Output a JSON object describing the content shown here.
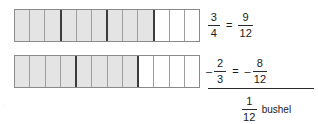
{
  "bar_models": [
    {
      "name": "three-fourths-bar",
      "total_segments": 12,
      "shaded_segments": 9,
      "major_divider_after": [
        3,
        6,
        9
      ],
      "represents": "3/4",
      "equivalent": "9/12"
    },
    {
      "name": "two-thirds-bar",
      "total_segments": 12,
      "shaded_segments": 8,
      "major_divider_after": [
        4,
        8
      ],
      "represents": "2/3",
      "equivalent": "8/12"
    }
  ],
  "equations": {
    "row1": {
      "left_fraction": {
        "numerator": "3",
        "denominator": "4"
      },
      "operator": "=",
      "right_fraction": {
        "numerator": "9",
        "denominator": "12"
      }
    },
    "row2": {
      "left_sign": "–",
      "left_fraction": {
        "numerator": "2",
        "denominator": "3"
      },
      "operator": "=",
      "right_sign": "–",
      "right_fraction": {
        "numerator": "8",
        "denominator": "12"
      }
    },
    "answer": {
      "fraction": {
        "numerator": "1",
        "denominator": "12"
      },
      "unit": "bushel"
    }
  },
  "artifact": {
    "mark": "·"
  },
  "colors": {
    "shade_fill": "#e4e4e4",
    "segment_border": "#9e9e9e",
    "outer_border": "#8a8a8a",
    "major_divider": "#3c3c3c",
    "text": "#1a1a1a",
    "background": "#ffffff"
  }
}
